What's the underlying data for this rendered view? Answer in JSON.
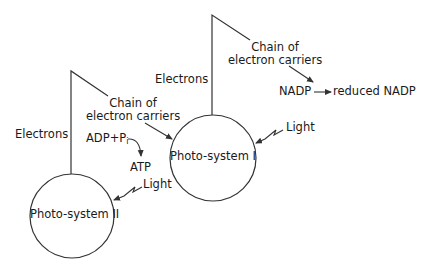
{
  "diagram": {
    "type": "Z-scheme of photosynthesis light reactions",
    "colors": {
      "stroke": "#333333",
      "text": "#1a1a1a",
      "background": "#ffffff"
    },
    "nodes": {
      "ps2": {
        "label": "Photo-system II"
      },
      "ps1": {
        "label": "Photo-system I"
      }
    },
    "labels": {
      "electrons_left": "Electrons",
      "electrons_right": "Electrons",
      "chain_left_line1": "Chain of",
      "chain_left_line2": "electron carriers",
      "chain_right_line1": "Chain of",
      "chain_right_line2": "electron carriers",
      "adp": "ADP+P",
      "adp_sub": "i",
      "atp": "ATP",
      "light_ps2": "Light",
      "light_ps1": "Light",
      "nadp": "NADP",
      "reduced_nadp": "reduced NADP"
    },
    "edges": [
      {
        "from": "Photo-system II",
        "to": "Chain of electron carriers (1)",
        "label": "Electrons"
      },
      {
        "from": "Chain of electron carriers (1)",
        "to": "Photo-system I"
      },
      {
        "from": "ADP+Pi",
        "to": "ATP"
      },
      {
        "from": "Light",
        "to": "Photo-system II"
      },
      {
        "from": "Photo-system I",
        "to": "Chain of electron carriers (2)",
        "label": "Electrons"
      },
      {
        "from": "Chain of electron carriers (2)",
        "to": "NADP"
      },
      {
        "from": "NADP",
        "to": "reduced NADP"
      },
      {
        "from": "Light",
        "to": "Photo-system I"
      }
    ]
  }
}
